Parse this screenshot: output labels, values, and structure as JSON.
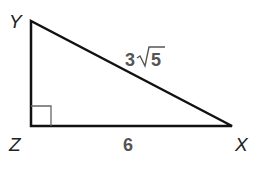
{
  "diagram": {
    "type": "right-triangle",
    "vertices": [
      {
        "name": "Y",
        "x": 31,
        "y": 21
      },
      {
        "name": "Z",
        "x": 31,
        "y": 126
      },
      {
        "name": "X",
        "x": 232,
        "y": 126
      }
    ],
    "right_angle_at": "Z",
    "labels": {
      "vertex_y": "Y",
      "vertex_z": "Z",
      "vertex_x": "X",
      "hypotenuse": "3√5",
      "hypotenuse_coef": "3",
      "hypotenuse_radicand": "5",
      "base": "6"
    },
    "colors": {
      "stroke": "#111111",
      "vertex_label": "#222222",
      "side_label": "#555555",
      "right_angle_marker": "#666666"
    }
  }
}
